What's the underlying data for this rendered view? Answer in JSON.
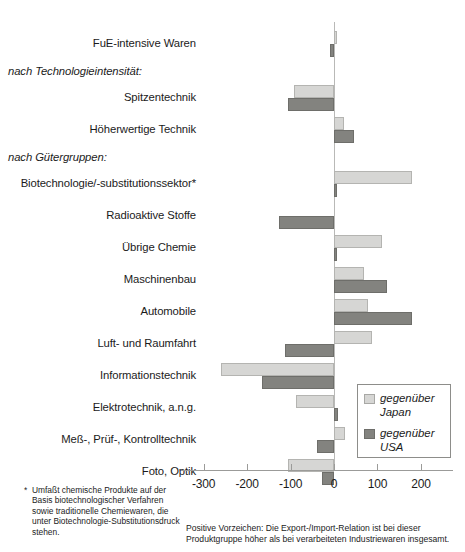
{
  "chart_data": {
    "type": "bar",
    "orientation": "horizontal",
    "title": "",
    "xlabel": "",
    "ylabel": "",
    "xlim": [
      -300,
      230
    ],
    "ticks": [
      -300,
      -200,
      -100,
      0,
      100,
      200
    ],
    "ticklabels": [
      "-300",
      "-200",
      "-100",
      "0",
      "100",
      "200"
    ],
    "grid": false,
    "legend_position": "bottom-right",
    "legend": [
      {
        "key": "japan",
        "label_line1": "gegenüber",
        "label_line2": "Japan",
        "color": "#d6d6d4"
      },
      {
        "key": "usa",
        "label_line1": "gegenüber",
        "label_line2": "USA",
        "color": "#83837f"
      }
    ],
    "categories": [
      "FuE-intensive Waren",
      "Spitzentechnik",
      "Höherwertige Technik",
      "Biotechnologie/-substitutionssektor*",
      "Radioaktive Stoffe",
      "Übrige Chemie",
      "Maschinenbau",
      "Automobile",
      "Luft- und Raumfahrt",
      "Informationstechnik",
      "Elektrotechnik, a.n.g.",
      "Meß-, Prüf-, Kontrolltechnik",
      "Foto, Optik"
    ],
    "series": [
      {
        "name": "gegenüber Japan",
        "values": [
          8,
          -93,
          23,
          180,
          0,
          110,
          68,
          78,
          88,
          -260,
          -88,
          25,
          -105
        ]
      },
      {
        "name": "gegenüber USA",
        "values": [
          -10,
          -105,
          45,
          8,
          -127,
          8,
          123,
          180,
          -113,
          -165,
          10,
          -38,
          -28
        ]
      }
    ],
    "group_headings": [
      {
        "text": "nach Technologieintensität:",
        "after_category_index": 0
      },
      {
        "text": "nach Gütergruppen:",
        "after_category_index": 2
      }
    ]
  },
  "footnote": {
    "marker": "*",
    "text": "Umfaßt chemische Produkte auf der Basis biotechnologischer Verfahren sowie traditionelle Chemiewaren, die unter Biotechnologie-Substitutionsdruck stehen."
  },
  "caption": {
    "line1": "Positive Vorzeichen: Die Export-/Import-Relation ist bei dieser",
    "line2": "Produktgruppe höher als bei verarbeiteten Industriewaren insgesamt."
  }
}
